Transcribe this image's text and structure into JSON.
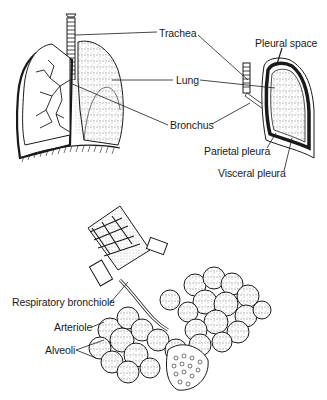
{
  "diagram": {
    "panels": [
      {
        "name": "lungs-overview",
        "labels": {
          "trachea": "Trachea",
          "lung": "Lung",
          "bronchus": "Bronchus"
        }
      },
      {
        "name": "pleura-cross-section",
        "labels": {
          "pleural_space": "Pleural space",
          "parietal_pleura": "Parietal pleura",
          "visceral_pleura": "Visceral pleura"
        }
      },
      {
        "name": "alveoli-detail",
        "labels": {
          "respiratory_bronchiole": "Respiratory bronchiole",
          "arteriole": "Arteriole",
          "alveoli": "Alveoli"
        }
      }
    ]
  },
  "colors": {
    "ink": "#1a1a1a",
    "background": "#ffffff",
    "stipple": "#555555"
  }
}
